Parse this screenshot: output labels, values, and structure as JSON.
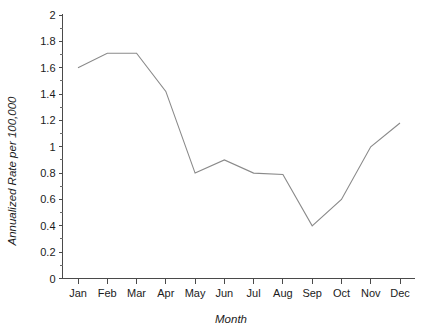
{
  "chart_data": {
    "type": "line",
    "title": "",
    "subtitle": "",
    "xlabel": "Month",
    "ylabel": "Annualized Rate per 100,000",
    "categories": [
      "Jan",
      "Feb",
      "Mar",
      "Apr",
      "May",
      "Jun",
      "Jul",
      "Aug",
      "Sep",
      "Oct",
      "Nov",
      "Dec"
    ],
    "values": [
      1.6,
      1.71,
      1.71,
      1.42,
      0.8,
      0.9,
      0.8,
      0.79,
      0.4,
      0.6,
      1.0,
      1.18
    ],
    "series": [
      {
        "name": "Annualized Rate",
        "values": [
          1.6,
          1.71,
          1.71,
          1.42,
          0.8,
          0.9,
          0.8,
          0.79,
          0.4,
          0.6,
          1.0,
          1.18
        ]
      }
    ],
    "ylim": [
      0,
      2
    ],
    "ytick_labels": [
      "0",
      "0.2",
      "0.4",
      "0.6",
      "0.8",
      "1",
      "1.2",
      "1.4",
      "1.6",
      "1.8",
      "2"
    ],
    "ytick_values": [
      0,
      0.2,
      0.4,
      0.6,
      0.8,
      1.0,
      1.2,
      1.4,
      1.6,
      1.8,
      2.0
    ],
    "yminor_step": 0.1,
    "xtick_labels": [
      "Jan",
      "Feb",
      "Mar",
      "Apr",
      "May",
      "Jun",
      "Jul",
      "Aug",
      "Sep",
      "Oct",
      "Nov",
      "Dec"
    ],
    "grid": false,
    "legend": false,
    "legend_position": "none",
    "line_color": "#8a8a8a",
    "axis_color": "#4a4a4a",
    "background_color": "#ffffff"
  },
  "labels": {
    "y_axis_title": "Annualized Rate per 100,000",
    "x_axis_title": "Month",
    "y0": "0",
    "y1": "0.2",
    "y2": "0.4",
    "y3": "0.6",
    "y4": "0.8",
    "y5": "1",
    "y6": "1.2",
    "y7": "1.4",
    "y8": "1.6",
    "y9": "1.8",
    "y10": "2",
    "x0": "Jan",
    "x1": "Feb",
    "x2": "Mar",
    "x3": "Apr",
    "x4": "May",
    "x5": "Jun",
    "x6": "Jul",
    "x7": "Aug",
    "x8": "Sep",
    "x9": "Oct",
    "x10": "Nov",
    "x11": "Dec"
  }
}
